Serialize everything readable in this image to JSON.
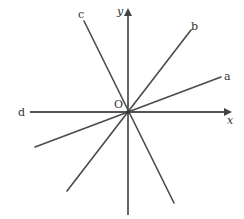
{
  "diagram": {
    "origin_label": "O",
    "x_axis_label": "x",
    "y_axis_label": "y",
    "lines": [
      {
        "id": "a",
        "label": "a"
      },
      {
        "id": "b",
        "label": "b"
      },
      {
        "id": "c",
        "label": "c"
      },
      {
        "id": "d",
        "label": "d"
      }
    ],
    "colors": {
      "line": "#4a4a4a",
      "axis": "#555555",
      "text": "#333333",
      "background": "#ffffff"
    }
  }
}
